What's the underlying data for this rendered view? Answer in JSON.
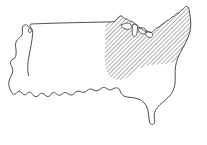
{
  "figure": {
    "type": "line-art-map",
    "width": 207,
    "height": 145,
    "background_color": "#ffffff",
    "outline_color": "#3a3a3a",
    "hatch_color": "#2e2e2e",
    "lake_fill_color": "#ffffff"
  },
  "map": {
    "subject": "contiguous-united-states",
    "projection_look": "simplified-freehand-outline",
    "labels": [],
    "legend": [],
    "annotations": []
  },
  "highlight": {
    "name": "hatched-region",
    "description": "Midwest and Northeast region filled with diagonal hatching",
    "fill_style": "diagonal-hatch",
    "hatch_angle_degrees": 45,
    "hatch_spacing_px": 3,
    "hatch_stroke_width_px": 0.75,
    "hatch_color": "#2e2e2e"
  },
  "geometry": {
    "national_outline": "M 28.5 75.5 C 27.0 69.0 27.8 62.0 29.2 55.0 C 30.6 48.0 32.0 41.0 32.6 34.5 C 32.9 31.2 32.4 29.2 31.4 28.4 C 30.3 27.6 29.2 28.3 28.6 29.4 C 28.1 30.4 28.2 31.6 28.9 32.2 C 29.7 32.9 30.8 32.4 31.2 31.3 C 31.6 30.2 31.2 28.8 30.6 27.6 C 30.1 26.5 29.6 25.6 29.9 24.9 C 30.3 24.0 31.6 23.9 33.3 23.9 C 41.0 23.6 52.0 23.2 64.0 22.9 C 80.0 22.5 97.5 22.2 105.5 22.0 L 112.0 21.9 C 113.6 21.9 114.7 21.5 115.6 20.6 C 116.8 19.4 117.6 17.8 118.8 16.8 C 120.0 15.8 121.3 15.6 122.3 16.4 C 123.1 17.0 123.5 18.1 124.3 18.6 C 125.2 19.1 126.3 18.8 127.2 19.2 C 128.1 19.6 128.6 20.6 129.6 21.0 C 130.6 21.5 131.9 21.3 132.8 21.8 C 133.6 22.3 133.9 23.3 134.6 23.9 C 135.4 24.6 136.6 24.7 137.4 25.4 C 138.1 26.1 138.3 27.3 139.1 27.9 C 139.9 28.5 141.1 28.4 142.0 28.9 C 142.9 29.4 143.4 30.4 144.4 30.8 C 145.4 31.2 146.6 31.0 147.6 31.3 C 148.5 31.6 149.1 32.3 150.0 32.5 C 151.1 32.7 152.3 32.2 153.2 31.4 C 154.3 30.5 154.9 29.2 156.0 28.4 C 157.0 27.7 158.2 27.6 159.1 27.0 C 160.0 26.4 160.5 25.3 161.4 24.6 C 162.3 23.9 163.5 23.7 164.4 23.0 C 165.2 22.4 165.6 21.3 166.5 20.7 C 167.3 20.2 168.4 20.3 169.2 19.8 C 170.1 19.3 170.5 18.2 171.3 17.5 C 172.1 16.9 173.2 16.8 174.1 16.2 C 175.0 15.5 175.5 14.2 176.5 13.6 C 177.4 13.1 178.6 13.2 179.4 12.6 C 180.2 12.0 180.5 10.9 181.2 10.2 C 181.9 9.6 182.9 9.4 183.6 8.8 C 184.4 8.1 184.8 6.9 185.7 6.5 C 186.6 6.1 187.7 6.5 188.3 7.3 C 188.9 8.1 189.0 9.2 189.2 10.3 C 189.7 13.1 190.2 16.0 190.5 18.9 C 190.8 21.8 190.9 24.8 190.6 27.7 C 190.3 30.6 189.6 33.4 188.6 36.1 C 187.6 38.8 186.3 41.4 185.0 43.9 C 183.5 46.8 181.9 49.6 180.4 52.4 C 178.8 55.4 177.4 58.5 176.5 61.7 C 175.6 64.9 175.2 68.3 175.1 71.7 C 175.1 74.7 175.3 77.7 175.2 80.7 C 175.1 83.8 174.6 86.9 173.4 89.8 C 172.3 92.5 170.6 95.0 168.6 97.1 C 166.7 99.1 164.5 100.8 162.4 102.6 C 160.7 104.0 159.0 105.5 157.6 107.2 C 156.3 108.8 155.2 110.6 154.6 112.5 C 154.1 114.2 154.0 116.0 154.3 117.7 C 154.5 119.0 154.9 120.3 154.8 121.6 C 154.7 122.7 154.2 123.8 153.3 124.3 C 152.4 124.8 151.3 124.5 150.6 123.8 C 149.9 123.1 149.6 122.1 149.4 121.1 C 148.9 118.4 148.8 115.7 148.4 113.0 C 148.0 110.4 147.4 107.8 146.1 105.5 C 145.0 103.5 143.4 101.8 141.5 100.6 C 139.8 99.5 137.9 98.8 136.0 98.3 C 134.1 97.8 132.1 97.6 130.2 97.4 C 128.4 97.2 126.6 97.0 124.9 96.4 C 123.3 95.8 121.8 94.7 121.0 93.2 C 120.3 91.9 120.2 90.3 119.3 89.2 C 118.4 88.0 116.8 87.6 115.4 87.9 C 114.2 88.1 113.2 88.9 112.1 89.4 C 110.9 90.0 109.5 90.1 108.3 89.6 C 107.2 89.1 106.4 88.1 105.3 87.7 C 104.1 87.2 102.7 87.5 101.6 88.1 C 100.6 88.7 99.8 89.6 98.8 90.2 C 97.7 90.8 96.4 91.0 95.2 90.7 C 94.1 90.4 93.2 89.7 92.2 89.3 C 91.0 88.8 89.6 88.9 88.5 89.5 C 87.5 90.1 86.8 91.0 85.8 91.6 C 84.7 92.3 83.4 92.5 82.2 92.2 C 81.1 92.0 80.2 91.4 79.1 91.2 C 78.0 91.0 76.8 91.2 75.9 91.8 C 74.8 92.5 74.2 93.7 73.1 94.4 C 72.0 95.1 70.6 95.2 69.5 94.7 C 68.5 94.3 67.8 93.5 66.9 93.0 C 65.9 92.4 64.7 92.3 63.7 92.8 C 62.7 93.3 62.0 94.3 61.0 94.8 C 59.9 95.4 58.6 95.4 57.6 94.8 C 56.7 94.3 56.2 93.4 55.3 92.9 C 54.3 92.3 53.0 92.4 52.1 93.1 C 51.2 93.8 50.8 95.0 49.9 95.8 C 48.9 96.6 47.5 96.7 46.4 96.2 C 45.4 95.7 44.8 94.8 44.0 94.1 C 43.0 93.3 41.6 93.0 40.5 93.6 C 39.5 94.1 38.9 95.2 37.9 95.9 C 36.8 96.7 35.3 96.8 34.2 96.1 C 33.2 95.5 32.7 94.3 31.9 93.4 C 31.1 92.5 29.9 91.9 28.8 92.3 C 27.8 92.6 27.2 93.6 26.4 94.2 C 25.4 95.0 24.0 95.0 23.0 94.3 C 22.1 93.7 21.7 92.6 20.9 91.9 C 20.1 91.2 18.9 91.0 18.0 91.5 C 17.1 92.0 16.6 93.0 15.8 93.6 C 14.9 94.3 13.6 94.4 12.7 93.8 C 11.9 93.3 11.5 92.4 11.1 91.6 C 10.2 89.8 9.4 88.0 9.0 86.1 C 8.6 84.1 8.7 82.0 9.3 80.1 C 9.9 78.2 10.9 76.5 11.7 74.7 C 12.5 72.9 13.0 70.9 12.6 69.0 C 12.3 67.4 11.3 66.0 10.8 64.5 C 10.3 63.0 10.4 61.2 11.5 60.1 C 12.4 59.2 13.8 59.0 14.7 58.1 C 15.6 57.2 15.9 55.8 16.0 54.5 C 16.2 52.8 16.2 51.1 16.0 49.4 C 15.8 47.7 15.4 46.0 15.5 44.3 C 15.6 42.7 16.2 41.1 17.2 39.9 C 18.1 38.8 19.3 38.1 20.3 37.1 C 21.4 36.0 22.2 34.6 22.4 33.1 C 22.6 31.7 22.3 30.3 22.3 28.9 C 22.3 27.6 22.6 26.2 23.6 25.4 C 24.5 24.7 25.8 24.7 26.8 25.2 C 27.7 25.7 28.3 26.6 28.9 27.4",
    "hatched_region": "M 105.5 22.2 L 112.0 22.0 C 113.8 22.0 114.9 21.4 115.9 20.4 C 117.1 19.2 117.9 17.7 119.0 16.8 C 120.2 15.9 121.4 15.8 122.4 16.5 C 123.2 17.1 123.6 18.2 124.4 18.7 C 125.3 19.2 126.4 18.9 127.3 19.3 C 128.2 19.7 128.7 20.7 129.7 21.1 C 130.7 21.6 132.0 21.4 132.9 21.9 C 133.7 22.4 134.0 23.4 134.7 24.0 C 135.5 24.7 136.7 24.8 137.5 25.5 C 138.2 26.2 138.4 27.4 139.2 28.0 C 140.0 28.6 141.2 28.5 142.1 29.0 C 143.0 29.5 143.5 30.5 144.5 30.9 C 145.5 31.3 146.7 31.1 147.7 31.4 C 148.6 31.7 149.2 32.4 150.1 32.6 C 151.2 32.8 152.4 32.3 153.3 31.5 C 154.4 30.6 155.0 29.3 156.1 28.5 C 157.1 27.8 158.3 27.7 159.2 27.1 C 160.1 26.5 160.6 25.4 161.5 24.7 C 162.4 24.0 163.6 23.8 164.5 23.1 C 165.3 22.5 165.7 21.4 166.6 20.8 C 167.4 20.3 168.5 20.4 169.3 19.9 C 170.2 19.4 170.6 18.3 171.4 17.6 C 172.2 17.0 173.3 16.9 174.2 16.3 C 175.1 15.6 175.6 14.3 176.6 13.7 C 177.5 13.2 178.7 13.3 179.5 12.7 C 180.3 12.1 180.6 11.0 181.3 10.3 C 182.0 9.7 183.0 9.5 183.7 8.9 C 184.5 8.2 184.9 7.0 185.8 6.6 C 186.7 6.2 187.8 6.6 188.4 7.4 C 189.0 8.2 189.1 9.3 189.3 10.4 C 189.8 13.2 190.3 16.1 190.6 19.0 C 190.9 21.9 191.0 24.9 190.7 27.8 C 190.4 30.7 189.7 33.5 188.7 36.2 C 187.7 38.9 186.4 41.5 185.1 44.0 C 183.6 46.9 182.0 49.7 180.5 52.5 C 179.4 54.6 178.4 56.7 177.6 58.9 C 176.0 60.5 174.0 61.7 171.9 62.5 C 169.3 63.5 166.5 63.9 163.7 64.1 C 160.4 64.4 157.1 64.3 153.8 64.5 C 150.6 64.7 147.4 65.2 144.4 66.2 C 141.5 67.2 138.8 68.7 136.3 70.5 C 133.9 72.2 131.7 74.2 129.3 75.9 C 127.0 77.5 124.5 78.9 121.8 79.5 C 119.3 80.1 116.6 80.0 114.2 79.1 C 112.1 78.3 110.3 76.9 108.9 75.2 C 107.5 73.5 106.5 71.5 105.9 69.4 C 105.2 67.1 105.0 64.7 104.9 62.3 C 104.7 58.7 104.8 55.1 104.9 51.5 C 105.0 47.0 105.1 42.5 105.2 38.0 C 105.3 33.6 105.4 29.2 105.5 24.8 Z",
    "great_lakes": [
      "M 121.5 25.0 C 122.8 24.2 124.2 23.6 125.6 23.3 C 127.0 23.0 128.5 23.1 129.7 23.8 C 130.6 24.3 131.2 25.2 131.4 26.2 C 131.6 27.1 131.3 28.1 130.6 28.7 C 129.8 29.4 128.7 29.5 127.7 29.4 C 126.2 29.3 124.8 28.8 123.5 28.1 C 122.4 27.5 121.3 26.6 121.1 25.9 C 121.0 25.5 121.2 25.2 121.5 25.0 Z",
      "M 133.0 24.5 C 134.0 24.0 135.2 23.9 136.2 24.4 C 137.0 24.8 137.5 25.7 137.5 26.6 C 137.5 28.4 137.4 30.2 137.2 32.0 C 137.1 33.2 136.9 34.5 136.2 35.4 C 135.6 36.2 134.5 36.5 133.6 36.1 C 132.8 35.8 132.4 34.9 132.3 34.0 C 132.0 31.6 132.2 29.2 132.5 26.8 C 132.6 26.0 132.7 25.1 133.0 24.5 Z",
      "M 139.5 28.0 C 140.8 27.5 142.3 27.4 143.6 27.9 C 144.7 28.3 145.6 29.2 146.0 30.3 C 146.3 31.2 146.2 32.3 145.6 33.0 C 144.9 33.8 143.7 34.0 142.6 33.8 C 141.2 33.5 139.9 32.7 139.1 31.6 C 138.5 30.8 138.3 29.7 138.7 28.9 C 138.9 28.5 139.2 28.2 139.5 28.0 Z",
      "M 147.0 32.0 C 148.4 31.6 150.0 31.7 151.2 32.4 C 152.2 33.0 152.8 34.1 152.7 35.2 C 152.6 36.2 151.9 37.1 150.9 37.4 C 149.7 37.8 148.4 37.4 147.4 36.7 C 146.4 36.0 145.7 34.9 145.8 33.8 C 145.8 33.0 146.3 32.3 147.0 32.0 Z"
    ]
  }
}
